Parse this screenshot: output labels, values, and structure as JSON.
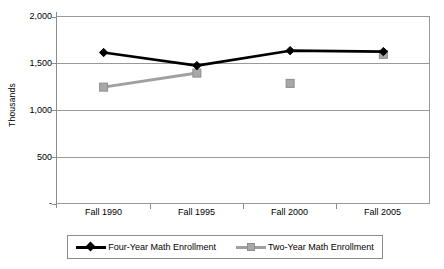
{
  "chart_data": {
    "type": "line",
    "title": "",
    "xlabel": "",
    "ylabel": "Thousands",
    "categories": [
      "Fall 1990",
      "Fall 1995",
      "Fall 2000",
      "Fall 2005"
    ],
    "ylim": [
      0,
      2000
    ],
    "y_ticks": [
      2000,
      1500,
      1000,
      500,
      0
    ],
    "y_tick_labels": [
      "2,000",
      "1,500",
      "1,000",
      "500",
      "-"
    ],
    "grid": true,
    "legend_position": "bottom",
    "series": [
      {
        "name": "Four-Year Math Enrollment",
        "color": "#000000",
        "marker": "diamond",
        "connected": true,
        "values": [
          1620,
          1480,
          1640,
          1630
        ]
      },
      {
        "name": "Two-Year Math Enrollment",
        "color": "#a0a0a0",
        "marker": "square",
        "connected": false,
        "connected_segments": [
          [
            0,
            1
          ]
        ],
        "values": [
          1250,
          1400,
          1290,
          1600
        ]
      }
    ]
  },
  "axis": {
    "y_title": "Thousands",
    "y_labels": [
      "2,000",
      "1,500",
      "1,000",
      "500",
      "-"
    ],
    "x_labels": [
      "Fall 1990",
      "Fall 1995",
      "Fall 2000",
      "Fall 2005"
    ]
  },
  "legend": {
    "entries": [
      {
        "label": "Four-Year Math Enrollment",
        "color": "#000000",
        "marker": "diamond"
      },
      {
        "label": "Two-Year Math Enrollment",
        "color": "#a0a0a0",
        "marker": "square"
      }
    ]
  },
  "colors": {
    "four_year": "#000000",
    "two_year": "#a0a0a0",
    "gridline": "#9a9a9a",
    "axis": "#8c8c8c",
    "background": "#ffffff"
  }
}
